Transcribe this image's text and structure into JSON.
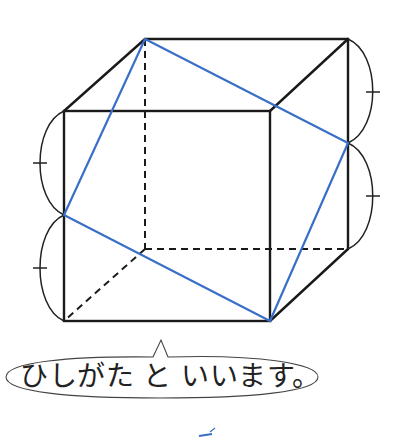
{
  "figure": {
    "type": "cube-with-rhombus",
    "colors": {
      "edge": "#1a1a1a",
      "rhombus": "#3a6fc8",
      "mark": "#3a6fc8"
    },
    "cube_vertices": {
      "front_top_left": [
        64,
        111
      ],
      "front_top_right": [
        270,
        111
      ],
      "front_bottom_left": [
        64,
        321
      ],
      "front_bottom_right": [
        270,
        321
      ],
      "back_top_left": [
        145,
        39
      ],
      "back_top_right": [
        348,
        39
      ],
      "back_bottom_left": [
        145,
        249
      ],
      "back_bottom_right": [
        348,
        249
      ]
    },
    "rhombus_vertices": [
      [
        145,
        39
      ],
      [
        348,
        143
      ],
      [
        270,
        321
      ],
      [
        64,
        215
      ]
    ],
    "equal_length_marks": 4
  },
  "speech_bubble": {
    "text": "ひしがた と いいます。"
  }
}
